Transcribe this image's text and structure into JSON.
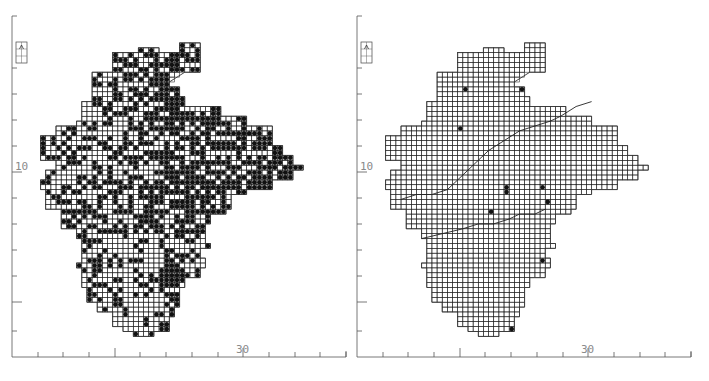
{
  "figure": {
    "panels": [
      {
        "id": "left",
        "offset_x": 0,
        "description": "Distribution map, many recorded squares",
        "axis": {
          "x_label_30": "30",
          "y_label_10": "10"
        },
        "dot_mode": "dense"
      },
      {
        "id": "right",
        "offset_x": 345,
        "description": "Distribution map, few recorded squares",
        "axis": {
          "x_label_30": "30",
          "y_label_10": "10"
        },
        "dot_mode": "sparse"
      }
    ],
    "axis_style": {
      "color": "#555555",
      "label_color": "#8a8a8a"
    },
    "grid_style": {
      "line_color": "#222222",
      "dot_color": "#111111"
    },
    "cell_size": 5.15,
    "x_ticks_px": [
      38,
      63,
      89,
      115,
      140,
      166,
      192,
      218,
      243,
      269,
      295,
      320,
      346
    ],
    "x_major_ticks_px": [
      115,
      243
    ],
    "y_ticks_px": [
      16,
      68,
      94,
      120,
      146,
      172,
      198,
      224,
      250,
      276,
      302,
      331
    ],
    "y_major_ticks_px": [
      172,
      302
    ],
    "legend_box": {
      "x": 16,
      "y": 42,
      "w": 11,
      "h": 21
    }
  },
  "map": {
    "outline_cells": [
      [
        36,
        2
      ],
      [
        40,
        2
      ],
      [
        40,
        0
      ],
      [
        44,
        0
      ],
      [
        44,
        2
      ],
      [
        44,
        6
      ],
      [
        41,
        6
      ],
      [
        38,
        8
      ],
      [
        38,
        9
      ],
      [
        40,
        9
      ],
      [
        40,
        11
      ],
      [
        41,
        11
      ],
      [
        41,
        13
      ],
      [
        48,
        13
      ],
      [
        48,
        15
      ],
      [
        53,
        15
      ],
      [
        53,
        17
      ],
      [
        58,
        17
      ],
      [
        58,
        21
      ],
      [
        60,
        21
      ],
      [
        60,
        23
      ],
      [
        62,
        23
      ],
      [
        62,
        25
      ],
      [
        64,
        25
      ],
      [
        64,
        26
      ],
      [
        62,
        26
      ],
      [
        62,
        28
      ],
      [
        58,
        28
      ],
      [
        58,
        30
      ],
      [
        53,
        30
      ],
      [
        53,
        31
      ],
      [
        50,
        31
      ],
      [
        50,
        34
      ],
      [
        49,
        34
      ],
      [
        49,
        35
      ],
      [
        46,
        35
      ],
      [
        46,
        37
      ],
      [
        45,
        37
      ],
      [
        45,
        41
      ],
      [
        46,
        41
      ],
      [
        46,
        42
      ],
      [
        44,
        42
      ],
      [
        44,
        44
      ],
      [
        45,
        44
      ],
      [
        45,
        46
      ],
      [
        44,
        46
      ],
      [
        44,
        48
      ],
      [
        41,
        48
      ],
      [
        41,
        50
      ],
      [
        40,
        50
      ],
      [
        40,
        54
      ],
      [
        39,
        54
      ],
      [
        39,
        56
      ],
      [
        38,
        56
      ],
      [
        38,
        59
      ],
      [
        35,
        59
      ],
      [
        35,
        60
      ],
      [
        31,
        60
      ],
      [
        31,
        59
      ],
      [
        29,
        59
      ],
      [
        29,
        58
      ],
      [
        27,
        58
      ],
      [
        27,
        55
      ],
      [
        24,
        55
      ],
      [
        24,
        53
      ],
      [
        22,
        53
      ],
      [
        22,
        50
      ],
      [
        21,
        50
      ],
      [
        21,
        46
      ],
      [
        20,
        46
      ],
      [
        20,
        45
      ],
      [
        21,
        45
      ],
      [
        21,
        40
      ],
      [
        20,
        40
      ],
      [
        20,
        38
      ],
      [
        17,
        38
      ],
      [
        17,
        36
      ],
      [
        17,
        34
      ],
      [
        14,
        34
      ],
      [
        14,
        30
      ],
      [
        13,
        30
      ],
      [
        13,
        28
      ],
      [
        14,
        28
      ],
      [
        14,
        26
      ],
      [
        16,
        26
      ],
      [
        16,
        24
      ],
      [
        13,
        24
      ],
      [
        13,
        19
      ],
      [
        16,
        19
      ],
      [
        16,
        17
      ],
      [
        20,
        17
      ],
      [
        20,
        16
      ],
      [
        21,
        16
      ],
      [
        21,
        12
      ],
      [
        23,
        12
      ],
      [
        23,
        6
      ],
      [
        27,
        6
      ],
      [
        27,
        2
      ],
      [
        32,
        2
      ],
      [
        32,
        1
      ],
      [
        36,
        1
      ]
    ],
    "origin_px": {
      "x": 49.5,
      "y": 62
    },
    "dense_empty_rows_pattern": [
      3,
      7,
      11,
      17,
      23,
      29,
      31,
      37,
      43,
      47,
      53
    ],
    "sparse_dots_cells": [
      [
        28,
        9
      ],
      [
        39,
        9
      ],
      [
        27,
        17
      ],
      [
        36,
        29
      ],
      [
        36,
        30
      ],
      [
        33,
        34
      ],
      [
        43,
        29
      ],
      [
        44,
        32
      ],
      [
        52,
        31
      ],
      [
        50,
        33
      ],
      [
        56,
        30
      ],
      [
        58,
        33
      ],
      [
        59,
        36
      ],
      [
        60,
        35
      ],
      [
        61,
        38
      ],
      [
        43,
        44
      ],
      [
        45,
        44
      ],
      [
        46,
        45
      ],
      [
        48,
        43
      ],
      [
        49,
        47
      ],
      [
        47,
        48
      ],
      [
        49,
        50
      ],
      [
        50,
        49
      ],
      [
        51,
        51
      ],
      [
        45,
        52
      ],
      [
        48,
        52
      ],
      [
        46,
        53
      ],
      [
        49,
        53
      ],
      [
        46,
        55
      ],
      [
        46,
        56
      ],
      [
        41,
        52
      ],
      [
        44,
        57
      ],
      [
        41,
        66
      ],
      [
        33,
        64
      ],
      [
        28,
        75
      ],
      [
        32,
        80
      ],
      [
        34,
        88
      ],
      [
        22,
        83
      ],
      [
        39,
        68
      ],
      [
        44,
        59
      ],
      [
        37,
        58
      ]
    ],
    "interior_lines": {
      "divide": [
        [
          16,
          32
        ],
        [
          19,
          31
        ],
        [
          22,
          31
        ],
        [
          25,
          30
        ],
        [
          27,
          28
        ],
        [
          29,
          26
        ],
        [
          31,
          24
        ],
        [
          33,
          22
        ],
        [
          36,
          20
        ],
        [
          39,
          18
        ],
        [
          42,
          17
        ],
        [
          45,
          16
        ],
        [
          47,
          15
        ],
        [
          50,
          13
        ],
        [
          53,
          12
        ]
      ],
      "south_coast_line": [
        [
          20,
          40
        ],
        [
          24,
          39
        ],
        [
          28,
          38
        ],
        [
          31,
          37
        ],
        [
          34,
          37
        ],
        [
          37,
          36
        ],
        [
          39,
          35
        ],
        [
          42,
          35
        ],
        [
          44,
          34
        ]
      ]
    }
  }
}
